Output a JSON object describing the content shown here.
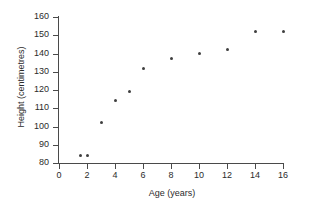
{
  "chart_data": {
    "type": "scatter",
    "title": "",
    "xlabel": "Age (years)",
    "ylabel": "Height (centimetres)",
    "xlim": [
      0,
      16
    ],
    "ylim": [
      80,
      160
    ],
    "xticks": [
      0,
      2,
      4,
      6,
      8,
      10,
      12,
      14,
      16
    ],
    "yticks": [
      80,
      90,
      100,
      110,
      120,
      130,
      140,
      150,
      160
    ],
    "xtick_labels": [
      "0",
      "2",
      "4",
      "6",
      "8",
      "10",
      "12",
      "14",
      "16"
    ],
    "ytick_labels": [
      "80",
      "90",
      "100",
      "110",
      "120",
      "130",
      "140",
      "150",
      "160"
    ],
    "grid": false,
    "legend": false,
    "series": [
      {
        "name": "Height vs Age",
        "marker": "circle",
        "color": "#3f3f3f",
        "x": [
          1.5,
          2,
          3,
          4,
          5,
          6,
          8,
          10,
          12,
          14,
          16
        ],
        "y": [
          84,
          84,
          102,
          114,
          119,
          132,
          137,
          140,
          142,
          152,
          152
        ],
        "points": [
          {
            "x": 1.5,
            "y": 84
          },
          {
            "x": 2,
            "y": 84
          },
          {
            "x": 3,
            "y": 102
          },
          {
            "x": 4,
            "y": 114
          },
          {
            "x": 5,
            "y": 119
          },
          {
            "x": 6,
            "y": 132
          },
          {
            "x": 8,
            "y": 137
          },
          {
            "x": 10,
            "y": 140
          },
          {
            "x": 12,
            "y": 142
          },
          {
            "x": 14,
            "y": 152
          },
          {
            "x": 16,
            "y": 152
          }
        ]
      }
    ],
    "axis_color": "#4a4a4a",
    "background": "#ffffff"
  }
}
